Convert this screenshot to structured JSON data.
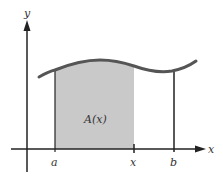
{
  "diagram": {
    "axes": {
      "x_label": "x",
      "y_label": "y"
    },
    "tick_labels": {
      "a": "a",
      "x": "x",
      "b": "b"
    },
    "region_label": "A(x)",
    "colors": {
      "curve": "#555555",
      "fill": "#c9c9c9",
      "axis": "#222222"
    }
  }
}
